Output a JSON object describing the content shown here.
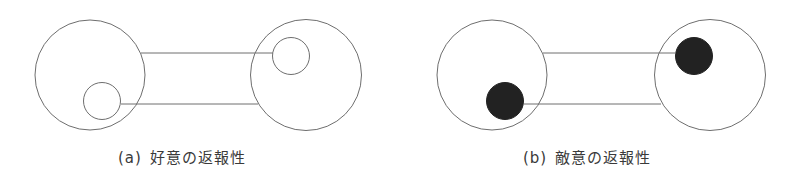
{
  "colors": {
    "stroke": "#6e6e6e",
    "fill_hostile": "#222222",
    "background": "#ffffff",
    "caption": "#3a3a3a"
  },
  "panels": [
    {
      "id": "a",
      "tag": "(a)",
      "title": "好意の返報性",
      "meaning": "reciprocity of liking",
      "inner_style": "outline",
      "left_person": {
        "cx": 90,
        "cy": 75,
        "r": 55
      },
      "left_inner": {
        "cx": 102,
        "cy": 101,
        "r": 18.5
      },
      "right_person": {
        "cx": 306,
        "cy": 75,
        "r": 55.5
      },
      "right_inner": {
        "cx": 291,
        "cy": 56,
        "r": 18.5
      },
      "top_line": {
        "x1": 141,
        "y1": 53,
        "x2": 273,
        "y2": 53
      },
      "bottom_line": {
        "x1": 121,
        "y1": 104,
        "x2": 258,
        "y2": 104
      }
    },
    {
      "id": "b",
      "tag": "(b)",
      "title": "敵意の返報性",
      "meaning": "reciprocity of hostility",
      "inner_style": "filled",
      "left_person": {
        "cx": 492,
        "cy": 75,
        "r": 55
      },
      "left_inner": {
        "cx": 505,
        "cy": 101,
        "r": 18.5
      },
      "right_person": {
        "cx": 710,
        "cy": 75,
        "r": 55.5
      },
      "right_inner": {
        "cx": 694,
        "cy": 56,
        "r": 18.5
      },
      "top_line": {
        "x1": 543,
        "y1": 53,
        "x2": 676,
        "y2": 53
      },
      "bottom_line": {
        "x1": 524,
        "y1": 104,
        "x2": 661,
        "y2": 104
      }
    }
  ]
}
